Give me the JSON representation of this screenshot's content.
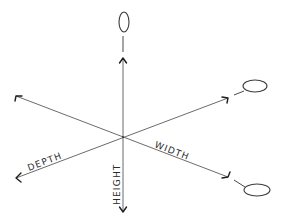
{
  "diagram": {
    "type": "3d-axes-sketch",
    "center": [
      123,
      137
    ],
    "axes": [
      {
        "name": "height",
        "label": "HEIGHT"
      },
      {
        "name": "width",
        "label": "WIDTH"
      },
      {
        "name": "depth",
        "label": "DEPTH"
      }
    ],
    "rotation_markers": 3,
    "colors": {
      "line": "#5a5a5a",
      "arrowhead": "#1e1e1e",
      "text": "#2a2a2a",
      "background": "#ffffff"
    }
  }
}
